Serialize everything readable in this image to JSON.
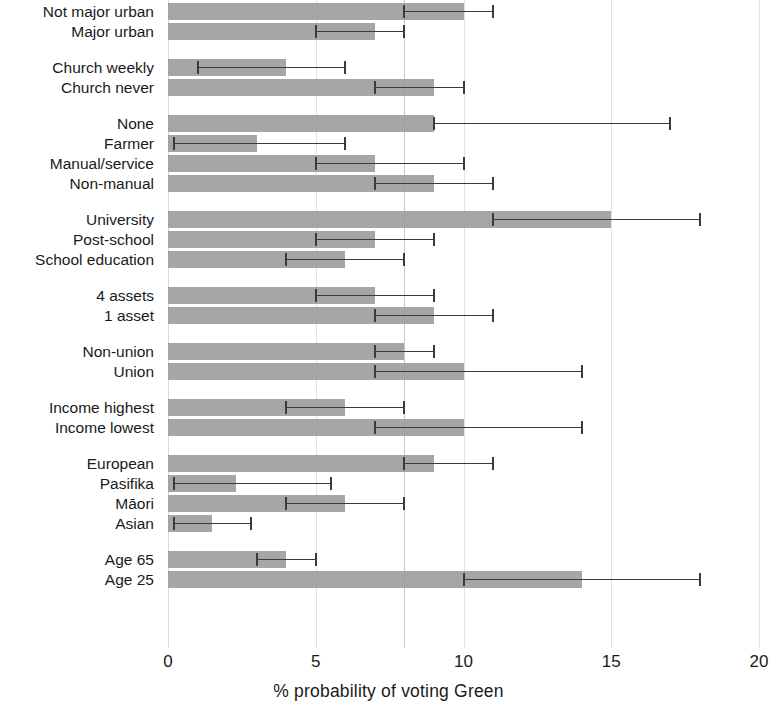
{
  "chart_data": {
    "type": "bar",
    "orientation": "horizontal",
    "title": "",
    "xlabel": "% probability of voting Green",
    "ylabel": "",
    "xlim": [
      0,
      20
    ],
    "xticks": [
      0,
      5,
      10,
      15,
      20
    ],
    "xtick_labels": [
      "0",
      "5",
      "10",
      "15",
      "20"
    ],
    "grid": true,
    "grid_axis": "x",
    "legend": "none",
    "reference_line": {
      "value": 8,
      "label": ""
    },
    "error_bars": "95% confidence interval",
    "bar_color": "#9a9a9a",
    "error_color": "#3b3b3b",
    "gridline_color": "#e2e2e2",
    "categories": [
      "Not major urban",
      "Major urban",
      "Church weekly",
      "Church never",
      "None",
      "Farmer",
      "Manual/service",
      "Non-manual",
      "University",
      "Post-school",
      "School education",
      "4 assets",
      "1 asset",
      "Non-union",
      "Union",
      "Income highest",
      "Income lowest",
      "European",
      "Pasifika",
      "Māori",
      "Asian",
      "Age 65",
      "Age 25"
    ],
    "values": [
      10,
      7,
      4,
      9,
      9,
      3,
      7,
      9,
      15,
      7,
      6,
      7,
      9,
      8,
      10,
      6,
      10,
      9,
      2.3,
      6,
      1.5,
      4,
      14
    ],
    "ci_low": [
      8,
      5,
      1,
      7,
      9,
      0.2,
      5,
      7,
      11,
      5,
      4,
      5,
      7,
      7,
      7,
      4,
      7,
      8,
      0.2,
      4,
      0.2,
      3,
      10
    ],
    "ci_high": [
      11,
      8,
      6,
      10,
      17,
      6,
      10,
      11,
      18,
      9,
      8,
      9,
      11,
      9,
      14,
      8,
      14,
      11,
      5.5,
      8,
      2.8,
      5,
      18
    ]
  },
  "rows": [
    {
      "label": "Not major urban",
      "value": 10,
      "low": 8,
      "high": 11,
      "group": 0
    },
    {
      "label": "Major urban",
      "value": 7,
      "low": 5,
      "high": 8,
      "group": 0
    },
    {
      "label": "Church weekly",
      "value": 4,
      "low": 1,
      "high": 6,
      "group": 1
    },
    {
      "label": "Church never",
      "value": 9,
      "low": 7,
      "high": 10,
      "group": 1
    },
    {
      "label": "None",
      "value": 9,
      "low": 9,
      "high": 17,
      "group": 2
    },
    {
      "label": "Farmer",
      "value": 3,
      "low": 0.2,
      "high": 6,
      "group": 2
    },
    {
      "label": "Manual/service",
      "value": 7,
      "low": 5,
      "high": 10,
      "group": 2
    },
    {
      "label": "Non-manual",
      "value": 9,
      "low": 7,
      "high": 11,
      "group": 2
    },
    {
      "label": "University",
      "value": 15,
      "low": 11,
      "high": 18,
      "group": 3
    },
    {
      "label": "Post-school",
      "value": 7,
      "low": 5,
      "high": 9,
      "group": 3
    },
    {
      "label": "School education",
      "value": 6,
      "low": 4,
      "high": 8,
      "group": 3
    },
    {
      "label": "4 assets",
      "value": 7,
      "low": 5,
      "high": 9,
      "group": 4
    },
    {
      "label": "1 asset",
      "value": 9,
      "low": 7,
      "high": 11,
      "group": 4
    },
    {
      "label": "Non-union",
      "value": 8,
      "low": 7,
      "high": 9,
      "group": 5
    },
    {
      "label": "Union",
      "value": 10,
      "low": 7,
      "high": 14,
      "group": 5
    },
    {
      "label": "Income highest",
      "value": 6,
      "low": 4,
      "high": 8,
      "group": 6
    },
    {
      "label": "Income lowest",
      "value": 10,
      "low": 7,
      "high": 14,
      "group": 6
    },
    {
      "label": "European",
      "value": 9,
      "low": 8,
      "high": 11,
      "group": 7
    },
    {
      "label": "Pasifika",
      "value": 2.3,
      "low": 0.2,
      "high": 5.5,
      "group": 7
    },
    {
      "label": "Māori",
      "value": 6,
      "low": 4,
      "high": 8,
      "group": 7
    },
    {
      "label": "Asian",
      "value": 1.5,
      "low": 0.2,
      "high": 2.8,
      "group": 7
    },
    {
      "label": "Age 65",
      "value": 4,
      "low": 3,
      "high": 5,
      "group": 8
    },
    {
      "label": "Age 25",
      "value": 14,
      "low": 10,
      "high": 18,
      "group": 8
    }
  ],
  "axis": {
    "ticks": [
      "0",
      "5",
      "10",
      "15",
      "20"
    ],
    "tick_values": [
      0,
      5,
      10,
      15,
      20
    ],
    "title": "% probability of voting Green"
  }
}
